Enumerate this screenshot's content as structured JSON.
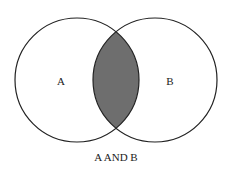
{
  "diagram": {
    "type": "venn",
    "sets": [
      {
        "label": "A",
        "cx": 77,
        "cy": 80,
        "r": 62
      },
      {
        "label": "B",
        "cx": 155,
        "cy": 80,
        "r": 62
      }
    ],
    "highlighted_region": "intersection",
    "fill_color": "#6e6e6e",
    "stroke_color": "#222222",
    "caption": "A AND B"
  }
}
